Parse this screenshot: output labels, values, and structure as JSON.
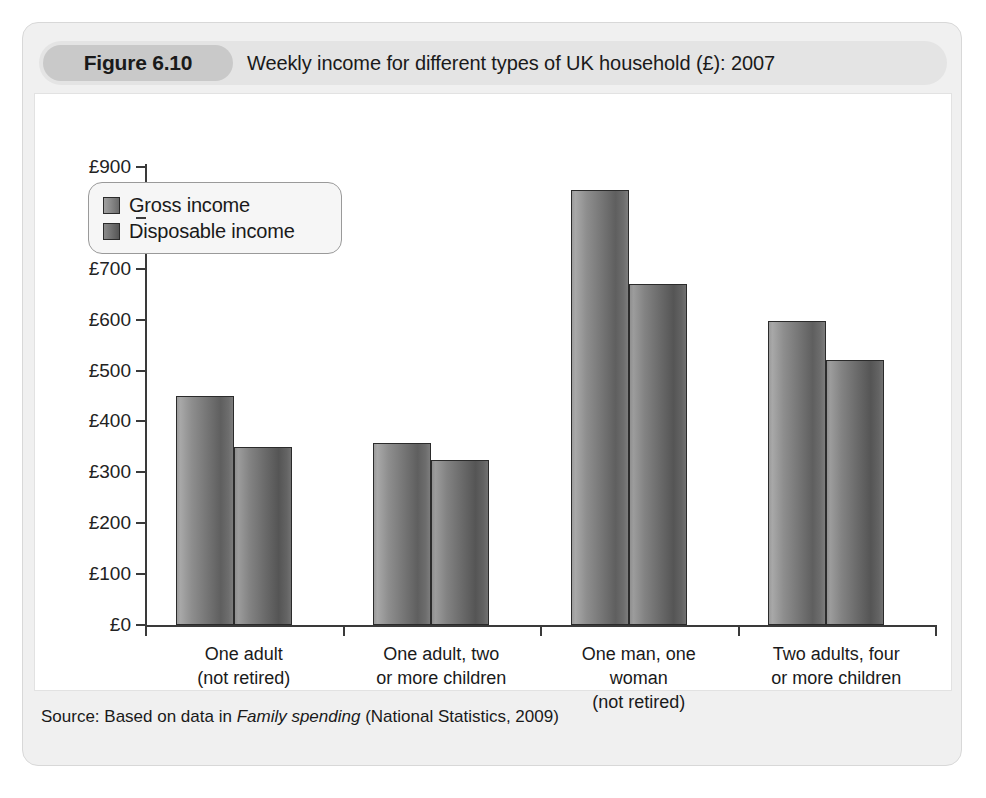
{
  "figure": {
    "number_label": "Figure 6.10",
    "title": "Weekly income for different types of UK household (£): 2007",
    "source_prefix": "Source: Based on data in ",
    "source_italic": "Family spending",
    "source_suffix": " (National Statistics, 2009)"
  },
  "chart_data": {
    "type": "bar",
    "title": "Weekly income for different types of UK household (£): 2007",
    "xlabel": "",
    "ylabel": "",
    "ylim": [
      0,
      900
    ],
    "grid": false,
    "legend_position": "top-left",
    "tick_labels": [
      "£0",
      "£100",
      "£200",
      "£300",
      "£400",
      "£500",
      "£600",
      "£700",
      "£800",
      "£900"
    ],
    "tick_values": [
      0,
      100,
      200,
      300,
      400,
      500,
      600,
      700,
      800,
      900
    ],
    "categories": [
      "One adult\n(not retired)",
      "One adult, two\nor more children",
      "One man, one\nwoman\n(not retired)",
      "Two adults, four\nor more children"
    ],
    "series": [
      {
        "name": "Gross income",
        "values": [
          450,
          357,
          855,
          598
        ]
      },
      {
        "name": "Disposable income",
        "values": [
          350,
          325,
          670,
          521
        ]
      }
    ]
  },
  "colors": {
    "card_background": "#f0f0f0",
    "header_background": "#e4e4e4",
    "badge_background": "#c9c9c9",
    "plot_background": "#ffffff",
    "axis": "#3a3a3a",
    "gross_bar": "#8a8a8a",
    "disposable_bar": "#6e6e6e",
    "text": "#1a1a1a"
  }
}
